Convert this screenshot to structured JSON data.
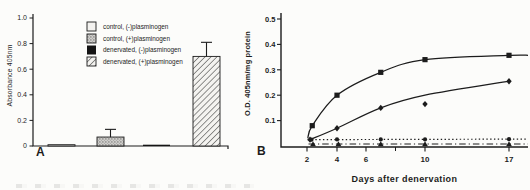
{
  "figure": {
    "panel_a_letter": "A",
    "panel_b_letter": "B",
    "colors": {
      "ink": "#1c1c1c",
      "paper": "#fcfcfa",
      "stipple_fill": "#cfcecb",
      "open_fill": "#f3f2ef"
    }
  },
  "chart_data": [
    {
      "type": "bar",
      "panel": "A",
      "title": "",
      "xlabel": "",
      "ylabel": "Absorbance 405nm",
      "ylim": [
        0,
        1.0
      ],
      "yticks": [
        0,
        0.2,
        0.4,
        0.6,
        0.8,
        1.0
      ],
      "ytick_labels": [
        "0",
        "0.2",
        "0.4",
        "0.6",
        "0.8",
        "1.0"
      ],
      "grid": false,
      "categories": [
        "control, (-)plasminogen",
        "control, (+)plasminogen",
        "denervated, (-)plasminogen",
        "denervated, (+)plasminogen"
      ],
      "values": [
        0.01,
        0.07,
        0.006,
        0.7
      ],
      "errors_plus": [
        0,
        0.06,
        0,
        0.11
      ],
      "bar_styles": [
        "open",
        "stippled",
        "solid-black",
        "hatched"
      ],
      "legend_position": "upper-center-inside",
      "legend": [
        {
          "swatch": "open",
          "label": "control, (-)plasminogen"
        },
        {
          "swatch": "stippled",
          "label": "control, (+)plasminogen"
        },
        {
          "swatch": "solid-black",
          "label": "denervated, (-)plasminogen"
        },
        {
          "swatch": "hatched",
          "label": "denervated, (+)plasminogen"
        }
      ]
    },
    {
      "type": "line",
      "panel": "B",
      "title": "",
      "xlabel": "Days after denervation",
      "ylabel": "O.D. 405nm/mg protein",
      "ylim": [
        0,
        0.5
      ],
      "yticks": [
        0.1,
        0.2,
        0.3,
        0.4,
        0.5
      ],
      "ytick_labels": [
        "0.1",
        "0.2",
        "0.3",
        "0.4",
        "0.5"
      ],
      "xticks": [
        2,
        4,
        6,
        10,
        17
      ],
      "xtick_labels": [
        "2",
        "4",
        "6",
        "10",
        "17"
      ],
      "xticks_minor": [
        8
      ],
      "grid": false,
      "legend_position": "none",
      "x_anchors": [
        [
          2,
          67
        ],
        [
          4,
          97
        ],
        [
          6,
          126
        ],
        [
          10,
          185
        ],
        [
          17,
          269
        ]
      ],
      "series": [
        {
          "name": "filled-squares-solid",
          "marker": "square",
          "line_style": "solid",
          "smooth": true,
          "days": [
            2.35,
            4,
            7,
            10,
            17
          ],
          "values": [
            0.08,
            0.2,
            0.29,
            0.34,
            0.357
          ],
          "line_days": [
            2.05,
            2.35,
            4,
            7,
            10,
            17
          ],
          "line_values": [
            0.03,
            0.08,
            0.2,
            0.29,
            0.34,
            0.357
          ],
          "extend_right": true
        },
        {
          "name": "filled-diamonds-solid",
          "marker": "diamond",
          "line_style": "solid",
          "smooth": true,
          "days": [
            2.2,
            4,
            7,
            10,
            17
          ],
          "values": [
            0.025,
            0.07,
            0.15,
            0.165,
            0.255
          ],
          "line_days": [
            2.2,
            4,
            7,
            10,
            17
          ],
          "line_values": [
            0.025,
            0.07,
            0.15,
            0.2,
            0.255
          ],
          "extend_right": false
        },
        {
          "name": "filled-circles-dotted",
          "marker": "circle",
          "line_style": "dotted",
          "smooth": false,
          "days": [
            2.3,
            4,
            7,
            10,
            17
          ],
          "values": [
            0.025,
            0.026,
            0.026,
            0.026,
            0.027
          ],
          "line_days": [
            2.05,
            17
          ],
          "line_values": [
            0.025,
            0.027
          ],
          "extend_right": true
        },
        {
          "name": "filled-triangles-dash-dot",
          "marker": "triangle",
          "line_style": "dashdot",
          "smooth": false,
          "days": [
            2.4,
            4.1,
            7,
            10,
            17
          ],
          "values": [
            0.008,
            0.008,
            0.008,
            0.008,
            0.008
          ],
          "line_days": [
            2.1,
            17
          ],
          "line_values": [
            0.008,
            0.008
          ],
          "extend_right": true
        }
      ]
    }
  ]
}
